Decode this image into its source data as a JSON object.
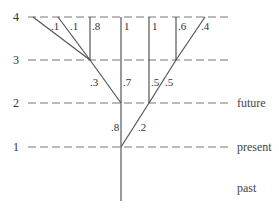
{
  "diagram": {
    "type": "probability-branching-tree",
    "levels": [
      {
        "label": "4",
        "y": 17,
        "x_end": 230
      },
      {
        "label": "3",
        "y": 60,
        "x_end": 228
      },
      {
        "label": "2",
        "y": 103,
        "x_end": 228
      },
      {
        "label": "1",
        "y": 147,
        "x_end": 228
      }
    ],
    "era_labels": {
      "future": "future",
      "present": "present",
      "past": "past"
    },
    "nodes": {
      "n1": {
        "x": 121,
        "y": 147
      },
      "a": {
        "x": 121,
        "y": 103
      },
      "b": {
        "x": 149,
        "y": 103
      },
      "c": {
        "x": 90,
        "y": 60
      },
      "d": {
        "x": 121,
        "y": 60
      },
      "e": {
        "x": 149,
        "y": 60
      },
      "f": {
        "x": 176,
        "y": 60
      }
    },
    "edges": [
      {
        "from": "a",
        "to_x": 121,
        "to_y": 103,
        "start_x": 121,
        "start_y": 147,
        "prob": ".8"
      },
      {
        "prob": ".2"
      },
      {
        "prob": ".3"
      },
      {
        "prob": ".7"
      },
      {
        "prob": ".5"
      },
      {
        "prob": ".5"
      },
      {
        "prob": ".1"
      },
      {
        "prob": ".1"
      },
      {
        "prob": ".8"
      },
      {
        "prob": "1"
      },
      {
        "prob": "1"
      },
      {
        "prob": ".6"
      },
      {
        "prob": ".4"
      }
    ],
    "past_trunk": {
      "x": 121,
      "y_top": 147,
      "y_bottom": 201
    }
  }
}
